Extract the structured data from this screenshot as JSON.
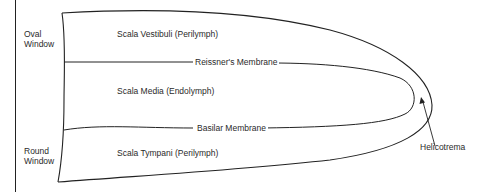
{
  "diagram": {
    "type": "cochlea-cross-section",
    "labels": {
      "oval_window": [
        "Oval",
        "Window"
      ],
      "round_window": [
        "Round",
        "Window"
      ],
      "scala_vestibuli": "Scala Vestibuli (Perilymph)",
      "scala_media": "Scala Media (Endolymph)",
      "scala_tympani": "Scala Tympani (Perilymph)",
      "reissners_membrane": "Reissner's Membrane",
      "basilar_membrane": "Basilar Membrane",
      "helicotrema": "Helicotrema"
    },
    "colors": {
      "line": "#222222",
      "text": "#2a2a2a",
      "background": "#ffffff"
    }
  }
}
